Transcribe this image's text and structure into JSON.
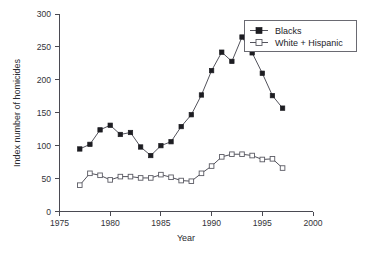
{
  "chart_data": {
    "type": "line",
    "title": "",
    "xlabel": "Year",
    "ylabel": "Index number of homicides",
    "xlim": [
      1975,
      2000
    ],
    "ylim": [
      0,
      300
    ],
    "xticks": [
      1975,
      1980,
      1985,
      1990,
      1995,
      2000
    ],
    "yticks": [
      0,
      50,
      100,
      150,
      200,
      250,
      300
    ],
    "grid": false,
    "legend_position": "top-right",
    "x": [
      1977,
      1978,
      1979,
      1980,
      1981,
      1982,
      1983,
      1984,
      1985,
      1986,
      1987,
      1988,
      1989,
      1990,
      1991,
      1992,
      1993,
      1994,
      1995,
      1996,
      1997
    ],
    "series": [
      {
        "name": "Blacks",
        "marker": "filled-square",
        "color": "#1d1d22",
        "values": [
          95,
          102,
          124,
          131,
          117,
          120,
          98,
          85,
          100,
          106,
          129,
          147,
          177,
          214,
          242,
          228,
          265,
          241,
          210,
          176,
          157
        ]
      },
      {
        "name": "White + Hispanic",
        "marker": "open-square",
        "color": "#5b5b64",
        "values": [
          40,
          58,
          55,
          48,
          53,
          53,
          51,
          51,
          56,
          52,
          47,
          46,
          58,
          69,
          83,
          87,
          87,
          85,
          79,
          80,
          66
        ]
      }
    ]
  },
  "axes": {
    "x_title": "Year",
    "y_title": "Index number of homicides",
    "x_tick_labels": [
      "1975",
      "1980",
      "1985",
      "1990",
      "1995",
      "2000"
    ],
    "y_tick_labels": [
      "0",
      "50",
      "100",
      "150",
      "200",
      "250",
      "300"
    ]
  },
  "legend": {
    "entries": [
      {
        "label": "Blacks",
        "marker": "filled-square-icon"
      },
      {
        "label": "White + Hispanic",
        "marker": "open-square-icon"
      }
    ]
  }
}
